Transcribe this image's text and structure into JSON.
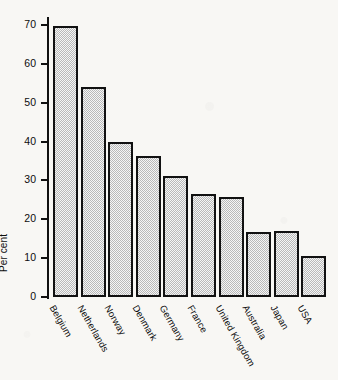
{
  "chart_data": {
    "type": "bar",
    "title": "",
    "subtitle": "",
    "xlabel": "",
    "ylabel": "Per cent",
    "categories": [
      "Belgium",
      "Netherlands",
      "Norway",
      "Denmark",
      "Germany",
      "France",
      "United Kingdom",
      "Australia",
      "Japan",
      "USA"
    ],
    "values": [
      69.7,
      54.0,
      40.0,
      36.3,
      31.2,
      26.6,
      25.8,
      16.8,
      16.9,
      10.6
    ],
    "ylim": [
      0,
      70
    ],
    "ytick_labels": [
      "0",
      "10",
      "20",
      "30",
      "40",
      "50",
      "60",
      "70"
    ],
    "ytick_values": [
      0,
      10,
      20,
      30,
      40,
      50,
      60,
      70
    ],
    "grid": false,
    "legend": null,
    "legend_position": "none",
    "bar_fill_color": "#b9b9b9",
    "bar_edge_color": "#111111",
    "background_color": "#f8f7f4",
    "annotations": []
  }
}
